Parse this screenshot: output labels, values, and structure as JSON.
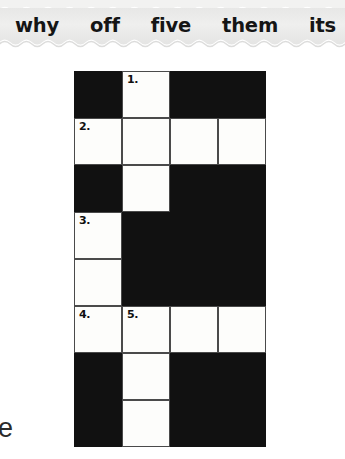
{
  "word_bank": {
    "background_color": "#ececeb",
    "words": [
      {
        "text": "why"
      },
      {
        "text": "off"
      },
      {
        "text": "five"
      },
      {
        "text": "them"
      },
      {
        "text": "its"
      }
    ]
  },
  "crossword": {
    "columns": 4,
    "rows": 8,
    "cell_size_px": 48,
    "black_color": "#111111",
    "white_color": "#fdfdfb",
    "cells": [
      {
        "row": 0,
        "col": 0,
        "state": "black",
        "number": ""
      },
      {
        "row": 0,
        "col": 1,
        "state": "white",
        "number": "1."
      },
      {
        "row": 0,
        "col": 2,
        "state": "black",
        "number": ""
      },
      {
        "row": 0,
        "col": 3,
        "state": "black",
        "number": ""
      },
      {
        "row": 1,
        "col": 0,
        "state": "white",
        "number": "2."
      },
      {
        "row": 1,
        "col": 1,
        "state": "white",
        "number": ""
      },
      {
        "row": 1,
        "col": 2,
        "state": "white",
        "number": ""
      },
      {
        "row": 1,
        "col": 3,
        "state": "white",
        "number": ""
      },
      {
        "row": 2,
        "col": 0,
        "state": "black",
        "number": ""
      },
      {
        "row": 2,
        "col": 1,
        "state": "white",
        "number": ""
      },
      {
        "row": 2,
        "col": 2,
        "state": "black",
        "number": ""
      },
      {
        "row": 2,
        "col": 3,
        "state": "black",
        "number": ""
      },
      {
        "row": 3,
        "col": 0,
        "state": "white",
        "number": "3."
      },
      {
        "row": 3,
        "col": 1,
        "state": "black",
        "number": ""
      },
      {
        "row": 3,
        "col": 2,
        "state": "black",
        "number": ""
      },
      {
        "row": 3,
        "col": 3,
        "state": "black",
        "number": ""
      },
      {
        "row": 4,
        "col": 0,
        "state": "white",
        "number": ""
      },
      {
        "row": 4,
        "col": 1,
        "state": "black",
        "number": ""
      },
      {
        "row": 4,
        "col": 2,
        "state": "black",
        "number": ""
      },
      {
        "row": 4,
        "col": 3,
        "state": "black",
        "number": ""
      },
      {
        "row": 5,
        "col": 0,
        "state": "white",
        "number": "4."
      },
      {
        "row": 5,
        "col": 1,
        "state": "white",
        "number": "5."
      },
      {
        "row": 5,
        "col": 2,
        "state": "white",
        "number": ""
      },
      {
        "row": 5,
        "col": 3,
        "state": "white",
        "number": ""
      },
      {
        "row": 6,
        "col": 0,
        "state": "black",
        "number": ""
      },
      {
        "row": 6,
        "col": 1,
        "state": "white",
        "number": ""
      },
      {
        "row": 6,
        "col": 2,
        "state": "black",
        "number": ""
      },
      {
        "row": 6,
        "col": 3,
        "state": "black",
        "number": ""
      },
      {
        "row": 7,
        "col": 0,
        "state": "black",
        "number": ""
      },
      {
        "row": 7,
        "col": 1,
        "state": "white",
        "number": ""
      },
      {
        "row": 7,
        "col": 2,
        "state": "black",
        "number": ""
      },
      {
        "row": 7,
        "col": 3,
        "state": "black",
        "number": ""
      }
    ]
  },
  "edge_text": {
    "clipped_glyph": "e"
  }
}
